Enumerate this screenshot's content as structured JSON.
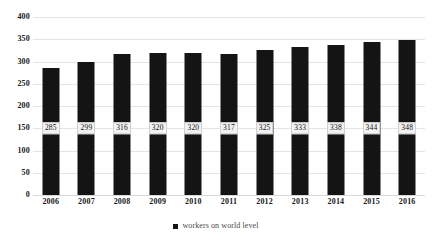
{
  "chart_data": {
    "type": "bar",
    "title": "",
    "subtitle": "",
    "xlabel": "",
    "ylabel": "",
    "categories": [
      "2006",
      "2007",
      "2008",
      "2009",
      "2010",
      "2011",
      "2012",
      "2013",
      "2014",
      "2015",
      "2016"
    ],
    "values": [
      285,
      299,
      316,
      320,
      320,
      317,
      325,
      333,
      338,
      344,
      348
    ],
    "data_labels": [
      "285",
      "299",
      "316",
      "320",
      "320",
      "317",
      "325",
      "333",
      "338",
      "344",
      "348"
    ],
    "series": [
      {
        "name": "workers on world level",
        "values": [
          285,
          299,
          316,
          320,
          320,
          317,
          325,
          333,
          338,
          344,
          348
        ],
        "color": "#141414"
      }
    ],
    "ylim": [
      0,
      400
    ],
    "ytick_step": 50,
    "yticks": [
      "0",
      "50",
      "100",
      "150",
      "200",
      "250",
      "300",
      "350",
      "400"
    ],
    "grid": true,
    "grid_color": "#e4e4e4",
    "legend": {
      "position": "bottom",
      "entries": [
        {
          "label": "workers on world level",
          "color": "#141414"
        }
      ]
    },
    "background_color": "#ffffff",
    "bar_color": "#141414",
    "data_label_position": "inside-bar"
  }
}
